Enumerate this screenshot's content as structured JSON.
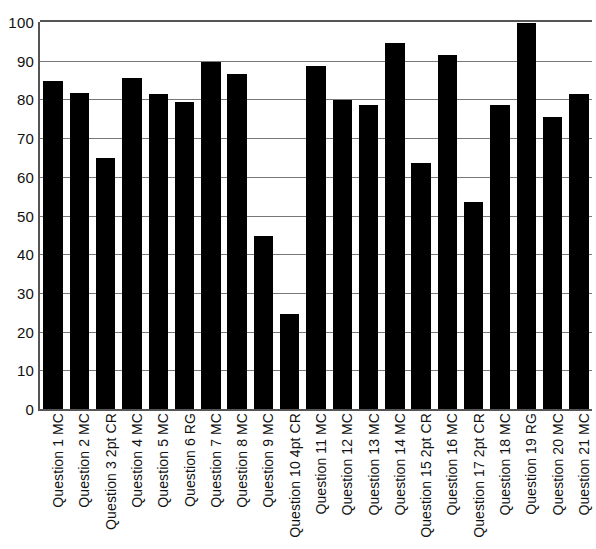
{
  "chart_data": {
    "type": "bar",
    "title": "",
    "subtitle": "",
    "xlabel": "",
    "ylabel": "",
    "ylim": [
      0,
      100
    ],
    "yticks": [
      0,
      10,
      20,
      30,
      40,
      50,
      60,
      70,
      80,
      90,
      100
    ],
    "grid": true,
    "legend": false,
    "legend_position": "none",
    "bar_color": "#000000",
    "axis_color": "#555555",
    "gridline_color": "#777777",
    "categories": [
      "Question 1 MC",
      "Question 2 MC",
      "Question 3 2pt CR",
      "Question 4 MC",
      "Question 5 MC",
      "Question 6 RG",
      "Question 7 MC",
      "Question 8 MC",
      "Question 9 MC",
      "Question 10 4pt CR",
      "Question 11 MC",
      "Question 12 MC",
      "Question 13 MC",
      "Question 14 MC",
      "Question 15 2pt CR",
      "Question 16 MC",
      "Question 17 2pt CR",
      "Question 18 MC",
      "Question 19 RG",
      "Question 20 MC",
      "Question 21 MC"
    ],
    "values": [
      84.7,
      81.6,
      64.8,
      85.5,
      81.5,
      79.4,
      89.6,
      86.6,
      44.7,
      24.6,
      88.6,
      79.8,
      78.5,
      94.5,
      63.6,
      91.4,
      53.6,
      78.5,
      99.7,
      75.5,
      81.5
    ]
  }
}
